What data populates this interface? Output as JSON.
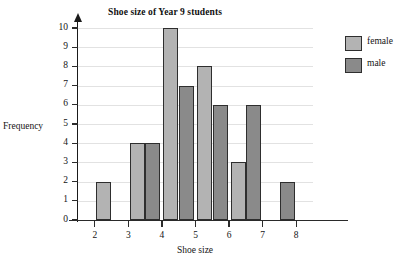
{
  "chart_data": {
    "type": "bar",
    "title": "Shoe size of Year 9 students",
    "xlabel": "Shoe size",
    "ylabel": "Frequency",
    "categories": [
      "2",
      "3",
      "4",
      "5",
      "6",
      "7",
      "8"
    ],
    "series": [
      {
        "name": "female",
        "color": "#b3b3b3",
        "values": [
          2,
          4,
          10,
          8,
          3,
          null,
          null
        ]
      },
      {
        "name": "male",
        "color": "#8a8a8a",
        "values": [
          null,
          null,
          4,
          7,
          6,
          6,
          2
        ]
      }
    ],
    "ylim": [
      0,
      10
    ],
    "ytick_labels": [
      "0",
      "1",
      "2",
      "3",
      "4",
      "5",
      "6",
      "7",
      "8",
      "9",
      "10"
    ],
    "ytick_values": [
      0,
      1,
      2,
      3,
      4,
      5,
      6,
      7,
      8,
      9,
      10
    ],
    "grid": true,
    "legend_position": "right",
    "bar_layout": "male-left-of-tick, female-right-of-tick",
    "axis_color": "#2a2a2a",
    "gridline_color": "#e2e2e2",
    "bar_border_color": "#2e2e2e"
  },
  "legend": {
    "entries": [
      {
        "label": "female",
        "color": "#b3b3b3"
      },
      {
        "label": "male",
        "color": "#8a8a8a"
      }
    ]
  }
}
